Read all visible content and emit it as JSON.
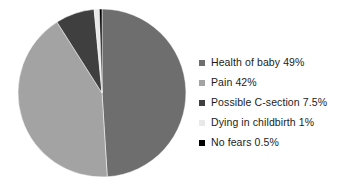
{
  "chart_data": {
    "type": "pie",
    "title": "",
    "subtitle": "",
    "xlabel": "",
    "ylabel": "",
    "legend_position": "right",
    "grid": false,
    "start_angle_deg": 0,
    "direction": "clockwise",
    "categories": [
      "Health of baby",
      "Pain",
      "Possible C-section",
      "Dying in childbirth",
      "No fears"
    ],
    "values": [
      49,
      42,
      7.5,
      1,
      0.5
    ],
    "value_unit": "%",
    "colors": [
      "#6e6e6e",
      "#a3a3a3",
      "#3f3f3f",
      "#e8e8e8",
      "#000000"
    ],
    "slices": [
      {
        "label": "Health of baby",
        "value": 49,
        "display": "49%",
        "color": "#6e6e6e"
      },
      {
        "label": "Pain",
        "value": 42,
        "display": "42%",
        "color": "#a3a3a3"
      },
      {
        "label": "Possible C-section",
        "value": 7.5,
        "display": "7.5%",
        "color": "#3f3f3f"
      },
      {
        "label": "Dying in childbirth",
        "value": 1,
        "display": "1%",
        "color": "#e8e8e8"
      },
      {
        "label": "No fears",
        "value": 0.5,
        "display": "0.5%",
        "color": "#000000"
      }
    ]
  },
  "legend": {
    "entries": [
      {
        "text": "Health of baby 49%",
        "color": "#6e6e6e"
      },
      {
        "text": "Pain 42%",
        "color": "#a3a3a3"
      },
      {
        "text": "Possible C-section 7.5%",
        "color": "#3f3f3f"
      },
      {
        "text": "Dying in childbirth 1%",
        "color": "#e8e8e8"
      },
      {
        "text": "No fears 0.5%",
        "color": "#000000"
      }
    ]
  }
}
